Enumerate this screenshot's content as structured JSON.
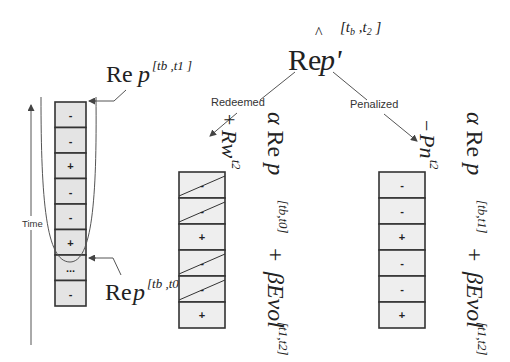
{
  "root": {
    "label": "Re p'",
    "hat": "^",
    "superscript": "[t_b, t_2]",
    "superscript_display": "[tb ,t2 ]"
  },
  "branches": {
    "redeemed": {
      "label": "Redeemed",
      "reward_term": "+ Rw^t2",
      "reward_display_sign": "+",
      "reward_display_main": "Rw",
      "reward_display_sup": "t2",
      "formula": "α Re p^[t_b,t_0] + βEvol^[t_1,t_2]",
      "formula_parts": {
        "alpha": "α Re p",
        "sup1": "[tb,t0]",
        "plus": "+",
        "beta": "βEvol",
        "sup2": "[t1,t2]"
      }
    },
    "penalized": {
      "label": "Penalized",
      "penalty_term": "− Pn^t2",
      "penalty_display_sign": "−",
      "penalty_display_main": "Pn",
      "penalty_display_sup": "t2",
      "formula": "α Re p^[t_b,t_1] + βEvol^[t_1,t_2]",
      "formula_parts": {
        "alpha": "α Re p",
        "sup1": "[tb,t1]",
        "plus": "+",
        "beta": "βEvol",
        "sup2": "[t1,t2]"
      }
    }
  },
  "history": {
    "axis_label": "Time",
    "top_label": {
      "main": "Re p",
      "sup": "[tb ,t1 ]"
    },
    "bottom_label": {
      "main": "Re p",
      "sup": "[tb ,t0 ]"
    },
    "cells": [
      "-",
      "-",
      "+",
      "-",
      "-",
      "+",
      "...",
      "-"
    ]
  },
  "redeemed_column": {
    "cells": [
      {
        "sign": "-",
        "struck": true
      },
      {
        "sign": "-",
        "struck": true
      },
      {
        "sign": "+",
        "struck": false
      },
      {
        "sign": "-",
        "struck": true
      },
      {
        "sign": "-",
        "struck": true
      },
      {
        "sign": "+",
        "struck": false
      }
    ]
  },
  "penalized_column": {
    "cells": [
      {
        "sign": "-",
        "struck": false
      },
      {
        "sign": "-",
        "struck": false
      },
      {
        "sign": "+",
        "struck": false
      },
      {
        "sign": "-",
        "struck": false
      },
      {
        "sign": "-",
        "struck": false
      },
      {
        "sign": "+",
        "struck": false
      }
    ]
  },
  "colors": {
    "cell_fill": "#e4e4e4",
    "stroke": "#333333",
    "text": "#222222"
  }
}
